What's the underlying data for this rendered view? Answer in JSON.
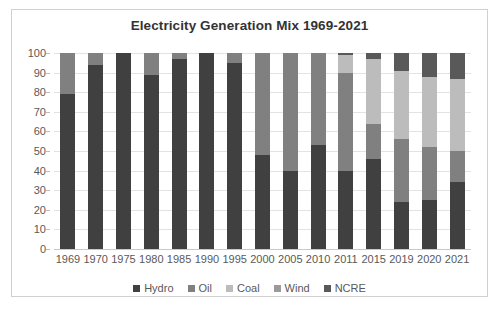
{
  "chart_data": {
    "type": "bar",
    "subtype": "stacked-column-100",
    "title": "Electricity Generation Mix 1969-2021",
    "xlabel": "",
    "ylabel": "",
    "ylim": [
      0,
      100
    ],
    "yticks": [
      0,
      10,
      20,
      30,
      40,
      50,
      60,
      70,
      80,
      90,
      100
    ],
    "ytick_labels": [
      "0",
      "10",
      "20",
      "30",
      "40",
      "50",
      "60",
      "70",
      "80",
      "90",
      "100"
    ],
    "grid": "horizontal",
    "legend_position": "bottom",
    "categories": [
      "1969",
      "1970",
      "1975",
      "1980",
      "1985",
      "1990",
      "1995",
      "2000",
      "2005",
      "2010",
      "2011",
      "2015",
      "2019",
      "2020",
      "2021"
    ],
    "series": [
      {
        "name": "Hydro",
        "color": "#404040",
        "values": [
          79,
          94,
          100,
          89,
          97,
          100,
          95,
          48,
          40,
          53,
          40,
          46,
          24,
          25,
          34
        ]
      },
      {
        "name": "Oil",
        "color": "#808080",
        "values": [
          21,
          6,
          0,
          11,
          3,
          0,
          5,
          52,
          60,
          47,
          50,
          18,
          32,
          27,
          16
        ]
      },
      {
        "name": "Coal",
        "color": "#bcbcbc",
        "values": [
          0,
          0,
          0,
          0,
          0,
          0,
          0,
          0,
          0,
          0,
          9,
          33,
          35,
          36,
          37
        ]
      },
      {
        "name": "Wind",
        "color": "#9a9a9a",
        "values": [
          0,
          0,
          0,
          0,
          0,
          0,
          0,
          0,
          0,
          0,
          0,
          0,
          0,
          0,
          0
        ]
      },
      {
        "name": "NCRE",
        "color": "#595959",
        "values": [
          0,
          0,
          0,
          0,
          0,
          0,
          0,
          0,
          0,
          0,
          1,
          3,
          9,
          12,
          13
        ]
      }
    ]
  },
  "legend": {
    "items": [
      {
        "label": "Hydro",
        "color": "#404040"
      },
      {
        "label": "Oil",
        "color": "#808080"
      },
      {
        "label": "Coal",
        "color": "#bcbcbc"
      },
      {
        "label": "Wind",
        "color": "#9a9a9a"
      },
      {
        "label": "NCRE",
        "color": "#595959"
      }
    ]
  },
  "colors": {
    "background": "#ffffff",
    "border": "#d0d0d0",
    "gridline": "#e3e3e3",
    "axis_text": "#595959",
    "title_text": "#333333"
  }
}
